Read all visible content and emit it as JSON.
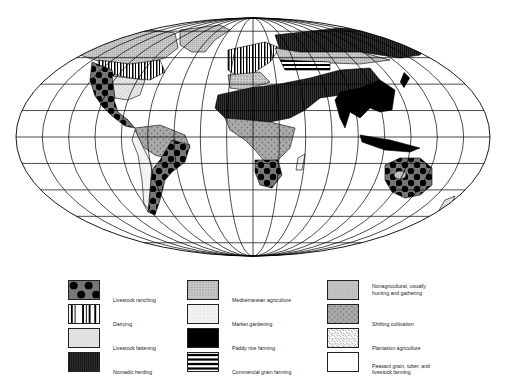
{
  "map": {
    "title": "World agricultural regions",
    "projection": "Robinson",
    "graticule": {
      "meridian_step_deg": 20,
      "parallel_step_deg": 20
    },
    "regions": [
      {
        "name": "North America west",
        "pattern": "livestock-ranching"
      },
      {
        "name": "North America north",
        "pattern": "nonagricultural"
      },
      {
        "name": "North America east",
        "pattern": "dairying"
      },
      {
        "name": "North America plains",
        "pattern": "commercial-grain"
      },
      {
        "name": "North America south-east",
        "pattern": "livestock-fattening"
      },
      {
        "name": "Mexico",
        "pattern": "peasant"
      },
      {
        "name": "Amazon",
        "pattern": "shifting-cultivation"
      },
      {
        "name": "Brazil east / Argentina",
        "pattern": "livestock-ranching"
      },
      {
        "name": "Greenland",
        "pattern": "nonagricultural"
      },
      {
        "name": "Europe",
        "pattern": "dairying"
      },
      {
        "name": "Mediterranean",
        "pattern": "mediterranean"
      },
      {
        "name": "Sahara / Arabia / Central Asia",
        "pattern": "nomadic-herding"
      },
      {
        "name": "Siberia",
        "pattern": "nonagricultural"
      },
      {
        "name": "Russia steppe",
        "pattern": "commercial-grain"
      },
      {
        "name": "Central Africa",
        "pattern": "shifting-cultivation"
      },
      {
        "name": "Southern Africa",
        "pattern": "livestock-ranching"
      },
      {
        "name": "China / India / SE Asia",
        "pattern": "paddy-rice"
      },
      {
        "name": "Australia",
        "pattern": "livestock-ranching"
      }
    ]
  },
  "legend": {
    "items": [
      {
        "key": "livestock-ranching",
        "label": "Livestock ranching"
      },
      {
        "key": "dairying",
        "label": "Dairying"
      },
      {
        "key": "livestock-fattening",
        "label": "Livestock fattening"
      },
      {
        "key": "nomadic-herding",
        "label": "Nomadic herding"
      },
      {
        "key": "mediterranean",
        "label": "Mediterranean agriculture"
      },
      {
        "key": "market-gardening",
        "label": "Market gardening"
      },
      {
        "key": "paddy-rice",
        "label": "Paddy rice farming"
      },
      {
        "key": "commercial-grain",
        "label": "Commercial grain farming"
      },
      {
        "key": "nonagricultural",
        "label": "Nonagricultural, usually\nhunting and gathering"
      },
      {
        "key": "shifting-cultivation",
        "label": "Shifting cultivation"
      },
      {
        "key": "plantation",
        "label": "Plantation agriculture"
      },
      {
        "key": "peasant",
        "label": "Peasant grain, tuber, and\nlivestock farming"
      }
    ]
  }
}
